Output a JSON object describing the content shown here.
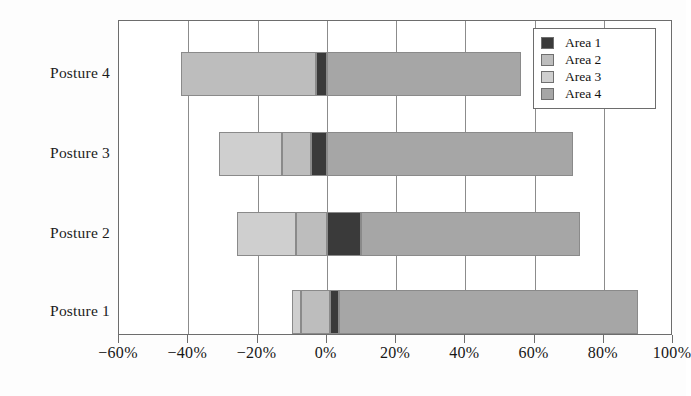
{
  "chart_data": {
    "type": "bar",
    "orientation": "horizontal",
    "stacked": true,
    "diverging": true,
    "title": "",
    "xlabel": "",
    "ylabel": "",
    "xlim": [
      -60,
      100
    ],
    "xtick_values": [
      -60,
      -40,
      -20,
      0,
      20,
      40,
      60,
      80,
      100
    ],
    "xtick_labels": [
      "−60%",
      "−40%",
      "−20%",
      "0%",
      "20%",
      "40%",
      "60%",
      "80%",
      "100%"
    ],
    "categories": [
      "Posture 1",
      "Posture 2",
      "Posture 3",
      "Posture 4"
    ],
    "category_order_top_to_bottom": [
      "Posture 4",
      "Posture 3",
      "Posture 2",
      "Posture 1"
    ],
    "grid": "vertical",
    "legend_position": "top-right",
    "series": [
      {
        "name": "Area 1",
        "color": "#3a3a3a",
        "values": [
          3.5,
          10.0,
          4.5,
          3.0
        ],
        "spans": [
          {
            "category": "Posture 1",
            "start": 1.0,
            "end": 3.5
          },
          {
            "category": "Posture 2",
            "start": 0.0,
            "end": 10.0
          },
          {
            "category": "Posture 3",
            "start": -4.5,
            "end": 0.0
          },
          {
            "category": "Posture 4",
            "start": -3.0,
            "end": 0.0
          }
        ]
      },
      {
        "name": "Area 2",
        "color": "#bdbdbd",
        "values": [
          8.5,
          9.0,
          8.5,
          39.0
        ],
        "spans": [
          {
            "category": "Posture 1",
            "start": -7.5,
            "end": 1.0
          },
          {
            "category": "Posture 2",
            "start": -9.0,
            "end": 0.0
          },
          {
            "category": "Posture 3",
            "start": -13.0,
            "end": -4.5
          },
          {
            "category": "Posture 4",
            "start": -42.0,
            "end": -3.0
          }
        ]
      },
      {
        "name": "Area 3",
        "color": "#cfcfcf",
        "values": [
          2.5,
          17.0,
          18.0,
          0.0
        ],
        "spans": [
          {
            "category": "Posture 1",
            "start": -10.0,
            "end": -7.5
          },
          {
            "category": "Posture 2",
            "start": -26.0,
            "end": -9.0
          },
          {
            "category": "Posture 3",
            "start": -31.0,
            "end": -13.0
          },
          {
            "category": "Posture 4",
            "start": 0.0,
            "end": 0.0
          }
        ]
      },
      {
        "name": "Area 4",
        "color": "#a6a6a6",
        "values": [
          86.5,
          63.0,
          71.0,
          56.0
        ],
        "spans": [
          {
            "category": "Posture 1",
            "start": 3.5,
            "end": 90.0
          },
          {
            "category": "Posture 2",
            "start": 10.0,
            "end": 73.0
          },
          {
            "category": "Posture 3",
            "start": 0.0,
            "end": 71.0
          },
          {
            "category": "Posture 4",
            "start": 0.0,
            "end": 56.0
          }
        ]
      }
    ],
    "bar_totals_negative": [
      -10.0,
      -26.0,
      -31.0,
      -42.0
    ],
    "bar_totals_positive": [
      90.0,
      73.0,
      71.0,
      56.0
    ]
  },
  "legend": {
    "items": [
      {
        "label": "Area 1",
        "color": "#3a3a3a"
      },
      {
        "label": "Area 2",
        "color": "#bdbdbd"
      },
      {
        "label": "Area 3",
        "color": "#cfcfcf"
      },
      {
        "label": "Area 4",
        "color": "#a6a6a6"
      }
    ]
  },
  "axis": {
    "y_labels_top_to_bottom": [
      "Posture 4",
      "Posture 3",
      "Posture 2",
      "Posture 1"
    ],
    "x_labels": [
      "−60%",
      "−40%",
      "−20%",
      "0%",
      "20%",
      "40%",
      "60%",
      "80%",
      "100%"
    ]
  }
}
